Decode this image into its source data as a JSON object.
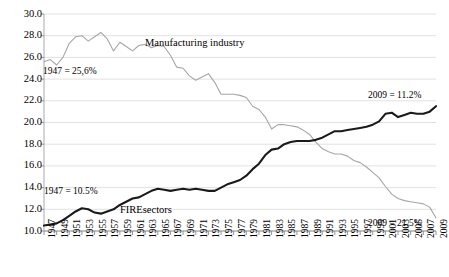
{
  "chart_data": {
    "type": "line",
    "title": "",
    "subtitle": "",
    "xlabel": "",
    "ylabel": "",
    "ylim": [
      10.0,
      30.0
    ],
    "xlim": [
      1947,
      2009
    ],
    "grid": true,
    "legend_position": "inline-annotations",
    "y_ticks": [
      "10.0",
      "12.0",
      "14.0",
      "16.0",
      "18.0",
      "20.0",
      "22.0",
      "24.0",
      "26.0",
      "28.0",
      "30.0"
    ],
    "x_ticks": [
      "1947",
      "1949",
      "1951",
      "1953",
      "1955",
      "1957",
      "1959",
      "1961",
      "1963",
      "1965",
      "1967",
      "1969",
      "1971",
      "1973",
      "1975",
      "1977",
      "1979",
      "1981",
      "1983",
      "1985",
      "1987",
      "1989",
      "1991",
      "1993",
      "1995",
      "1997",
      "1999",
      "2001",
      "2003",
      "2005",
      "2007",
      "2009"
    ],
    "x": [
      1947,
      1948,
      1949,
      1950,
      1951,
      1952,
      1953,
      1954,
      1955,
      1956,
      1957,
      1958,
      1959,
      1960,
      1961,
      1962,
      1963,
      1964,
      1965,
      1966,
      1967,
      1968,
      1969,
      1970,
      1971,
      1972,
      1973,
      1974,
      1975,
      1976,
      1977,
      1978,
      1979,
      1980,
      1981,
      1982,
      1983,
      1984,
      1985,
      1986,
      1987,
      1988,
      1989,
      1990,
      1991,
      1992,
      1993,
      1994,
      1995,
      1996,
      1997,
      1998,
      1999,
      2000,
      2001,
      2002,
      2003,
      2004,
      2005,
      2006,
      2007,
      2008,
      2009
    ],
    "series": [
      {
        "name": "Manufacturing industry",
        "color": "#a6a6a6",
        "start_label": "1947 = 25,6%",
        "end_label": "2009 = 11.2%",
        "values": [
          25.6,
          25.8,
          25.3,
          26.0,
          27.3,
          27.9,
          28.0,
          27.5,
          27.9,
          28.3,
          27.7,
          26.6,
          27.4,
          27.0,
          26.6,
          27.1,
          27.2,
          26.9,
          27.1,
          27.0,
          26.2,
          25.1,
          25.0,
          24.3,
          23.9,
          24.2,
          24.5,
          23.7,
          22.6,
          22.6,
          22.6,
          22.5,
          22.3,
          21.5,
          21.2,
          20.5,
          19.4,
          19.8,
          19.8,
          19.7,
          19.6,
          19.3,
          18.9,
          18.2,
          17.6,
          17.3,
          17.1,
          17.1,
          16.9,
          16.5,
          16.3,
          15.9,
          15.4,
          14.9,
          14.1,
          13.4,
          13.0,
          12.8,
          12.7,
          12.6,
          12.5,
          12.2,
          11.2
        ]
      },
      {
        "name": "FIREsectors",
        "color": "#1a1a1a",
        "start_label": "1947 = 10.5%",
        "end_label": "2009 = 21,5%",
        "values": [
          10.5,
          10.6,
          10.7,
          11.0,
          11.4,
          11.8,
          12.1,
          12.0,
          11.7,
          11.6,
          11.8,
          12.0,
          12.4,
          12.7,
          13.0,
          13.1,
          13.4,
          13.7,
          13.9,
          13.8,
          13.7,
          13.8,
          13.9,
          13.8,
          13.9,
          13.8,
          13.7,
          13.7,
          14.0,
          14.3,
          14.5,
          14.7,
          15.1,
          15.7,
          16.2,
          17.0,
          17.5,
          17.6,
          18.0,
          18.2,
          18.3,
          18.3,
          18.3,
          18.4,
          18.6,
          18.9,
          19.2,
          19.2,
          19.3,
          19.4,
          19.5,
          19.6,
          19.8,
          20.1,
          20.8,
          20.9,
          20.5,
          20.7,
          20.9,
          20.8,
          20.8,
          21.0,
          21.5
        ]
      }
    ],
    "annotations": [
      {
        "text": "Manufacturing industry",
        "x_px": 145,
        "y_px": 37
      },
      {
        "text": "FIREsectors",
        "x_px": 120,
        "y_px": 204
      },
      {
        "text": "1947 = 25,6%",
        "x_px": 43,
        "y_px": 66
      },
      {
        "text": "1947 = 10.5%",
        "x_px": 44,
        "y_px": 186
      },
      {
        "text": "2009 = 21,5%",
        "x_px": 368,
        "y_px": 90
      },
      {
        "text": "2009 = 11.2%",
        "x_px": 368,
        "y_px": 218
      }
    ]
  },
  "plot_geometry": {
    "left": 44,
    "right": 436,
    "top": 14,
    "bottom": 231
  }
}
